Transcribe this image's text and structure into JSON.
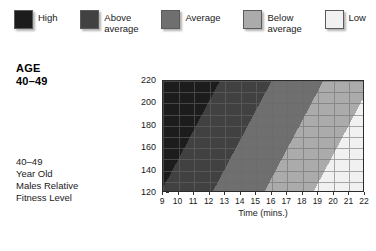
{
  "legend": {
    "items": [
      {
        "label": "High",
        "color": "#1c1c1c"
      },
      {
        "label": "Above\naverage",
        "color": "#414141"
      },
      {
        "label": "Average",
        "color": "#6f6f6f"
      },
      {
        "label": "Below\naverage",
        "color": "#ababab"
      },
      {
        "label": "Low",
        "color": "#f1f1f1"
      }
    ]
  },
  "side_panel": {
    "heading": "AGE\n40–49",
    "caption": "40–49\nYear Old\nMales Relative\nFitness Level"
  },
  "chart_data": {
    "type": "area",
    "title": "",
    "xlabel": "Time (mins.)",
    "ylabel": "Heart Rate (beats/min)",
    "xlim": [
      9,
      22
    ],
    "ylim": [
      120,
      220
    ],
    "xticks": [
      9,
      10,
      11,
      12,
      13,
      14,
      15,
      16,
      17,
      18,
      19,
      20,
      21,
      22
    ],
    "yticks": [
      220,
      200,
      180,
      160,
      140,
      120
    ],
    "grid": true,
    "legend_position": "top",
    "band_angle_deg": 118,
    "bands": [
      {
        "name": "High",
        "color": "#1c1c1c",
        "stop_start": 0,
        "stop_end": 22
      },
      {
        "name": "Above average",
        "color": "#414141",
        "stop_start": 22,
        "stop_end": 42
      },
      {
        "name": "Average",
        "color": "#6f6f6f",
        "stop_start": 42,
        "stop_end": 62
      },
      {
        "name": "Below average",
        "color": "#ababab",
        "stop_start": 62,
        "stop_end": 81
      },
      {
        "name": "Low",
        "color": "#f1f1f1",
        "stop_start": 81,
        "stop_end": 100
      }
    ],
    "grid_color": "#6a6a6a",
    "axis_color": "#2b2b2b"
  }
}
